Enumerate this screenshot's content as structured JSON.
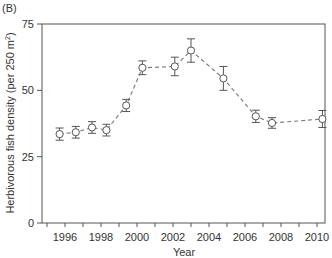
{
  "panel_label": "(B)",
  "chart_data": {
    "type": "line",
    "title": "",
    "xlabel": "Year",
    "ylabel": "Herbivorous fish density (per 250 m²)",
    "ylabel_main": "Herbivorous fish density (per 250 m",
    "ylabel_sup": "2",
    "ylabel_close": ")",
    "xlim": [
      1995,
      2010.5
    ],
    "ylim": [
      0,
      75
    ],
    "x_major_ticks": [
      1996,
      1998,
      2000,
      2002,
      2004,
      2006,
      2008,
      2010
    ],
    "x_minor_ticks": [
      1995,
      1997,
      1999,
      2001,
      2003,
      2005,
      2007,
      2009
    ],
    "x_tick_labels": [
      "1996",
      "1998",
      "2000",
      "2002",
      "2004",
      "2006",
      "2008",
      "2010"
    ],
    "y_ticks": [
      0,
      25,
      50,
      75
    ],
    "y_tick_labels": [
      "0",
      "25",
      "50",
      "75"
    ],
    "grid": false,
    "legend": null,
    "series": [
      {
        "name": "Herbivorous fish density",
        "style": "dashed line, open circle markers with error bars",
        "x": [
          1995.7,
          1996.6,
          1997.5,
          1998.3,
          1999.4,
          2000.3,
          2002.1,
          2003.0,
          2004.8,
          2006.6,
          2007.5,
          2010.3
        ],
        "y": [
          33.5,
          34.2,
          36.0,
          35.0,
          44.3,
          58.5,
          59.0,
          65.0,
          54.5,
          40.2,
          37.7,
          39.2
        ],
        "error": [
          2.3,
          2.2,
          2.2,
          2.2,
          2.3,
          2.6,
          3.5,
          4.4,
          4.5,
          2.3,
          2.0,
          3.2
        ]
      }
    ]
  }
}
